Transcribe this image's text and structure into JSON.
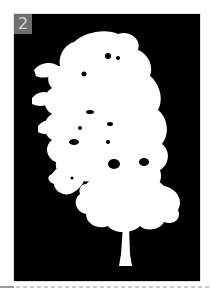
{
  "card": {
    "number_badge": "2",
    "image": {
      "subject": "tree-silhouette",
      "background_color": "#000000",
      "foreground_color": "#ffffff"
    }
  },
  "colors": {
    "page_background": "#ffffff",
    "badge_background": "#6e6e6e",
    "badge_text": "#d8d8d8",
    "divider_solid": "#9a9a9a",
    "divider_dashed": "#c9c9c9"
  }
}
